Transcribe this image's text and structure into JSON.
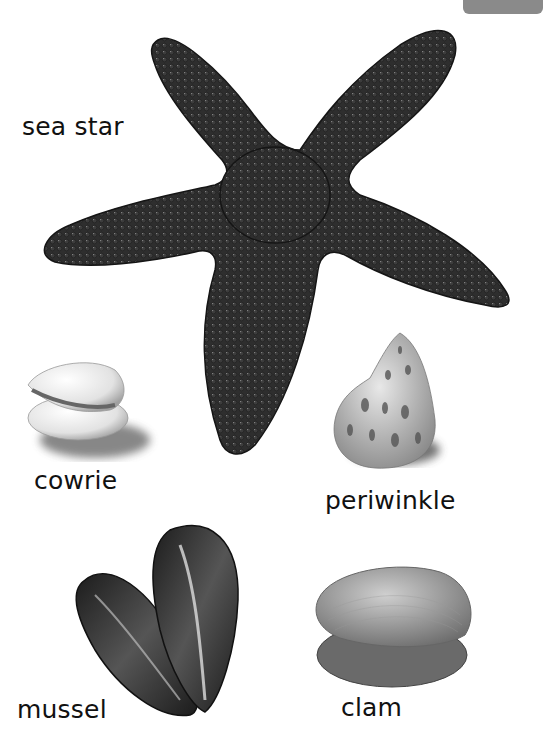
{
  "page": {
    "corner_tab_color": "#8a8a8a",
    "background": "#ffffff"
  },
  "creatures": [
    {
      "id": "sea-star",
      "label": "sea star"
    },
    {
      "id": "cowrie",
      "label": "cowrie"
    },
    {
      "id": "periwinkle",
      "label": "periwinkle"
    },
    {
      "id": "mussel",
      "label": "mussel"
    },
    {
      "id": "clam",
      "label": "clam"
    }
  ]
}
